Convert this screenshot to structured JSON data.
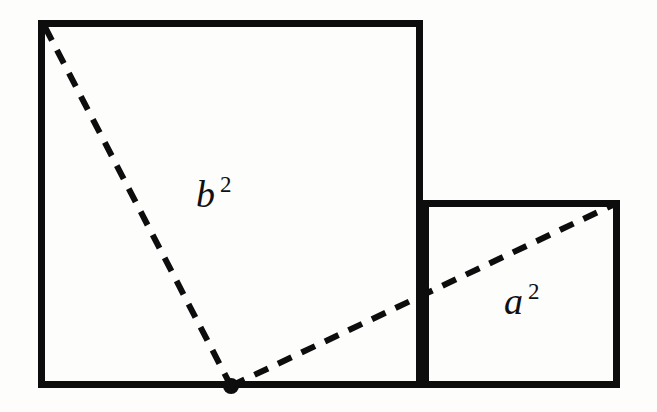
{
  "figure": {
    "name": "pythagorean-squares-diagram",
    "kind": "geometry-diagram",
    "background_color": "#fdfdfc",
    "stroke_color": "#0d0d0d",
    "canvas": {
      "width": 657,
      "height": 412
    }
  },
  "shapes": {
    "large_square": {
      "name": "b-squared-square",
      "x": 38,
      "y": 20,
      "width": 385,
      "height": 368,
      "stroke_width": 7
    },
    "small_square": {
      "name": "a-squared-square",
      "x": 422,
      "y": 200,
      "width": 198,
      "height": 188,
      "stroke_width": 7
    }
  },
  "vertex": {
    "name": "right-angle-vertex",
    "cx": 231,
    "cy": 386,
    "r": 8,
    "color": "#0d0d0d"
  },
  "dashed_lines": [
    {
      "name": "b-hypotenuse-line",
      "x1": 45,
      "y1": 27,
      "x2": 231,
      "y2": 386,
      "stroke_width": 6,
      "dash": "15 11"
    },
    {
      "name": "a-hypotenuse-line",
      "x1": 231,
      "y1": 386,
      "x2": 617,
      "y2": 203,
      "stroke_width": 6,
      "dash": "15 11"
    }
  ],
  "labels": {
    "b_square": {
      "base": "b",
      "exponent": "2",
      "x": 196,
      "y": 207,
      "exp_dx": 24,
      "exp_dy": -15
    },
    "a_square": {
      "base": "a",
      "exponent": "2",
      "x": 504,
      "y": 314,
      "exp_dx": 24,
      "exp_dy": -15
    }
  }
}
